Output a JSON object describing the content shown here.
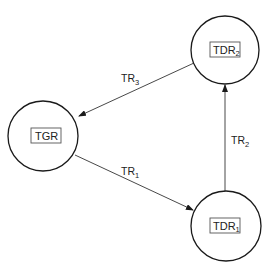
{
  "diagram": {
    "nodes": [
      {
        "id": "TGR",
        "label": "TGR",
        "subscript": ""
      },
      {
        "id": "TDR1",
        "label": "TDR",
        "subscript": "1"
      },
      {
        "id": "TDR2",
        "label": "TDR",
        "subscript": "2"
      }
    ],
    "edges": [
      {
        "id": "TR1",
        "from": "TGR",
        "to": "TDR1",
        "label": "TR",
        "subscript": "1"
      },
      {
        "id": "TR2",
        "from": "TDR1",
        "to": "TDR2",
        "label": "TR",
        "subscript": "2"
      },
      {
        "id": "TR3",
        "from": "TDR2",
        "to": "TGR",
        "label": "TR",
        "subscript": "3"
      }
    ],
    "colors": {
      "stroke": "#1a1a1a",
      "text": "#222222",
      "background": "#ffffff"
    }
  }
}
